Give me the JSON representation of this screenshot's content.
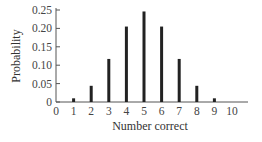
{
  "chart_data": {
    "type": "bar",
    "title": "",
    "xlabel": "Number correct",
    "ylabel": "Probability",
    "categories": [
      "0",
      "1",
      "2",
      "3",
      "4",
      "5",
      "6",
      "7",
      "8",
      "9",
      "10"
    ],
    "values": [
      0.001,
      0.01,
      0.044,
      0.117,
      0.205,
      0.246,
      0.205,
      0.117,
      0.044,
      0.01,
      0.001
    ],
    "ylim": [
      0,
      0.25
    ],
    "yticks": [
      "0",
      "0.05",
      "0.10",
      "0.15",
      "0.20",
      "0.25"
    ],
    "ytick_values": [
      0,
      0.05,
      0.1,
      0.15,
      0.2,
      0.25
    ],
    "grid": false,
    "legend": null,
    "bar_color": "#222222"
  }
}
